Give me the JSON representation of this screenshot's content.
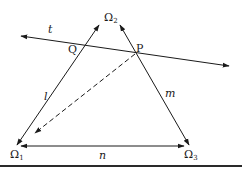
{
  "diagram": {
    "type": "geometry-triangle-with-transversal",
    "colors": {
      "ink": "#1a1a1a",
      "background": "#ffffff",
      "rule": "#2a2a2a"
    },
    "vertices": [
      {
        "id": "omega1",
        "label": "Ω",
        "subscript": "1"
      },
      {
        "id": "omega2",
        "label": "Ω",
        "subscript": "2"
      },
      {
        "id": "omega3",
        "label": "Ω",
        "subscript": "3"
      }
    ],
    "lines": [
      {
        "id": "t",
        "label": "t",
        "style": "solid",
        "arrows": "both"
      },
      {
        "id": "l",
        "label": "l",
        "style": "solid",
        "arrows": "both",
        "from": "Ω1",
        "to": "Ω2"
      },
      {
        "id": "m",
        "label": "m",
        "style": "solid",
        "arrows": "both",
        "from": "Ω2",
        "to": "Ω3"
      },
      {
        "id": "n",
        "label": "n",
        "style": "solid",
        "arrows": "both",
        "from": "Ω1",
        "to": "Ω3"
      },
      {
        "id": "dashed",
        "label": "",
        "style": "dashed",
        "arrows": "end",
        "from": "P",
        "to": "toward Ω1"
      }
    ],
    "points": [
      {
        "id": "Q",
        "label": "Q",
        "on": [
          "t",
          "l"
        ]
      },
      {
        "id": "P",
        "label": "P",
        "on": [
          "t",
          "m"
        ]
      }
    ]
  }
}
